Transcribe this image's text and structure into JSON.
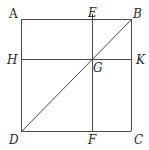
{
  "figure": {
    "type": "geometric-diagram",
    "colors": {
      "line": "#4a4a4a",
      "label": "#2a2a2a",
      "background": "#ffffff"
    },
    "points": {
      "A": {
        "label": "A",
        "x": 21,
        "y": 19
      },
      "B": {
        "label": "B",
        "x": 131,
        "y": 19
      },
      "C": {
        "label": "C",
        "x": 131,
        "y": 131
      },
      "D": {
        "label": "D",
        "x": 21,
        "y": 131
      },
      "E": {
        "label": "E",
        "x": 92,
        "y": 19
      },
      "F": {
        "label": "F",
        "x": 92,
        "y": 131
      },
      "H": {
        "label": "H",
        "x": 21,
        "y": 59
      },
      "K": {
        "label": "K",
        "x": 131,
        "y": 59
      },
      "G": {
        "label": "G",
        "x": 92,
        "y": 59
      }
    },
    "segments": [
      "AB",
      "BC",
      "CD",
      "DA",
      "DB",
      "EF",
      "HK"
    ],
    "labels": {
      "A": "A",
      "B": "B",
      "C": "C",
      "D": "D",
      "E": "E",
      "F": "F",
      "G": "G",
      "H": "H",
      "K": "K"
    }
  }
}
